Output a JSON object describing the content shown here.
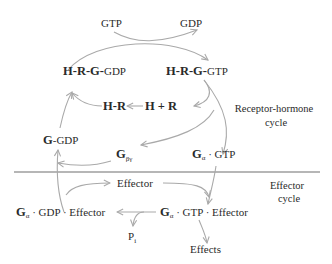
{
  "diagram": {
    "type": "cycle-diagram",
    "nodes": {
      "gtp": "GTP",
      "gdp": "GDP",
      "hrg_gdp": {
        "bold": "H-R-G-",
        "normal": "GDP"
      },
      "hrg_gtp": {
        "bold": "H-R-G-",
        "normal": "GTP"
      },
      "hr": "H-R",
      "h_plus_r": "H + R",
      "g_gdp": {
        "bold": "G",
        "normal": "-GDP"
      },
      "g_beta_gamma": {
        "bold": "G",
        "sub": "βγ"
      },
      "g_alpha_gtp": {
        "bold": "G",
        "sub": "α",
        "normal": " · GTP"
      },
      "effector": "Effector",
      "g_alpha_gdp_effector": {
        "bold": "G",
        "sub": "α",
        "normal": " · GDP · Effector"
      },
      "g_alpha_gtp_effector": {
        "bold": "G",
        "sub": "α",
        "normal": " · GTP · Effector"
      },
      "pi": {
        "normal": "P",
        "sub": "i"
      },
      "effects": "Effects"
    },
    "regions": {
      "receptor_hormone": {
        "line1": "Receptor-hormone",
        "line2": "cycle"
      },
      "effector": {
        "line1": "Effector",
        "line2": "cycle"
      }
    },
    "colors": {
      "arrow": "#a9a9a9",
      "divider": "#6f6f6f",
      "text": "#2a2a2a"
    }
  }
}
